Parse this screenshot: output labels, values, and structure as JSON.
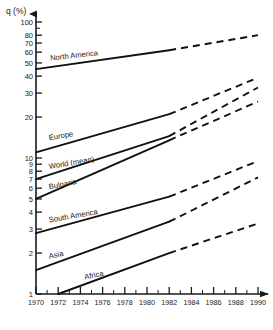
{
  "chart_data": {
    "type": "line",
    "title": "",
    "xlabel": "",
    "ylabel": "q (%)",
    "y_scale": "log",
    "ylim": [
      1,
      100
    ],
    "xlim": [
      1970,
      1990
    ],
    "grid": false,
    "legend_position": "inline-labels",
    "x_ticks": [
      1970,
      1972,
      1974,
      1976,
      1978,
      1980,
      1982,
      1984,
      1986,
      1988,
      1990
    ],
    "x_tick_labels": [
      "1970",
      "1972",
      "1974",
      "1976",
      "1978",
      "1980",
      "1982",
      "1984",
      "1986",
      "1988",
      "1990"
    ],
    "y_ticks": [
      1,
      2,
      3,
      4,
      5,
      6,
      7,
      8,
      9,
      10,
      20,
      30,
      40,
      50,
      60,
      70,
      80,
      100
    ],
    "y_tick_labels": [
      "1",
      "2",
      "3",
      "4",
      "5",
      "6",
      "7",
      "8",
      "9",
      "10",
      "20",
      "30",
      "40",
      "50",
      "60",
      "70",
      "80",
      "100"
    ],
    "forecast_start": 1982,
    "series": [
      {
        "name": "North America",
        "label": "North America",
        "x": [
          1970,
          1982,
          1990
        ],
        "values": [
          45,
          62,
          80
        ]
      },
      {
        "name": "Europe",
        "label": "Europe",
        "x": [
          1970,
          1982,
          1990
        ],
        "values": [
          11,
          21,
          39
        ]
      },
      {
        "name": "World (mean)",
        "label": "World (mean)",
        "x": [
          1970,
          1982,
          1990
        ],
        "values": [
          7.0,
          14.5,
          33
        ]
      },
      {
        "name": "Bulgaria",
        "label": "Bulgaria",
        "x": [
          1970,
          1982,
          1990
        ],
        "values": [
          5.0,
          13.5,
          26
        ]
      },
      {
        "name": "South America",
        "label": "South America",
        "x": [
          1970,
          1982,
          1990
        ],
        "values": [
          2.8,
          5.2,
          9.5
        ]
      },
      {
        "name": "Asia",
        "label": "Asia",
        "x": [
          1970,
          1982,
          1990
        ],
        "values": [
          1.5,
          3.4,
          7.2
        ]
      },
      {
        "name": "Africa",
        "label": "Africa",
        "x": [
          1972,
          1982,
          1990
        ],
        "values": [
          1.0,
          2.0,
          3.3
        ]
      }
    ],
    "series_label_positions": [
      {
        "name": "North America",
        "x": 1971.3,
        "y_value": 52,
        "rotate": -6.5
      },
      {
        "name": "Europe",
        "x": 1971.2,
        "y_value": 13.5,
        "rotate": -9.5
      },
      {
        "name": "World (mean)",
        "x": 1971.2,
        "y_value": 8.3,
        "rotate": -9.5
      },
      {
        "name": "Bulgaria",
        "x": 1971.2,
        "y_value": 5.9,
        "rotate": -10.5
      },
      {
        "name": "South America",
        "x": 1971.2,
        "y_value": 3.35,
        "rotate": -10
      },
      {
        "name": "Asia",
        "x": 1971.2,
        "y_value": 1.82,
        "rotate": -11
      },
      {
        "name": "Africa",
        "x": 1974.4,
        "y_value": 1.28,
        "rotate": -11
      }
    ]
  }
}
